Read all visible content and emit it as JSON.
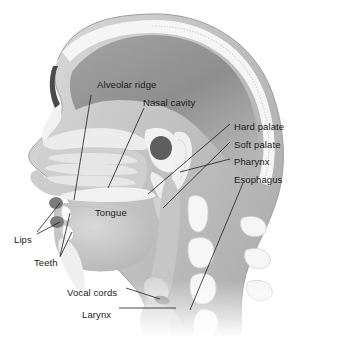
{
  "figure": {
    "view": "lateral midsagittal cutaway, facing left",
    "background_color": "#ffffff",
    "label_text_color": "#1a1a1a",
    "leader_line_color": "#1d1d1d",
    "tissue_light": "#e8e8e8",
    "tissue_mid": "#c9c9c9",
    "tissue_dark": "#9a9a9a",
    "bone_color": "#f4f4f4",
    "cavity_dark": "#6f6f6f"
  },
  "labels": [
    {
      "id": "alveolar-ridge",
      "text": "Alveolar ridge",
      "x": 97,
      "y": 80,
      "align": "left"
    },
    {
      "id": "nasal-cavity",
      "text": "Nasal cavity",
      "x": 143,
      "y": 98,
      "align": "left"
    },
    {
      "id": "hard-palate",
      "text": "Hard palate",
      "x": 234,
      "y": 122,
      "align": "left"
    },
    {
      "id": "soft-palate",
      "text": "Soft palate",
      "x": 234,
      "y": 140,
      "align": "left"
    },
    {
      "id": "pharynx",
      "text": "Pharynx",
      "x": 234,
      "y": 157,
      "align": "left"
    },
    {
      "id": "esophagus",
      "text": "Esophagus",
      "x": 234,
      "y": 175,
      "align": "left"
    },
    {
      "id": "tongue",
      "text": "Tongue",
      "x": 95,
      "y": 208,
      "align": "left"
    },
    {
      "id": "lips",
      "text": "Lips",
      "x": 14,
      "y": 235,
      "align": "left"
    },
    {
      "id": "teeth",
      "text": "Teeth",
      "x": 34,
      "y": 258,
      "align": "left"
    },
    {
      "id": "vocal-cords",
      "text": "Vocal cords",
      "x": 67,
      "y": 288,
      "align": "left"
    },
    {
      "id": "larynx",
      "text": "Larynx",
      "x": 82,
      "y": 310,
      "align": "left"
    }
  ],
  "leaders": [
    {
      "id": "leader-alveolar-ridge",
      "points": "91,95 74,200"
    },
    {
      "id": "leader-nasal-cavity",
      "points": "144,108 108,188"
    },
    {
      "id": "leader-hard-palate",
      "points": "230,124 148,194"
    },
    {
      "id": "leader-soft-palate",
      "points": "230,142 163,208"
    },
    {
      "id": "leader-pharynx",
      "points": "230,159 180,172"
    },
    {
      "id": "leader-esophagus",
      "points": "243,183 190,310"
    },
    {
      "id": "leader-lips-upper",
      "points": "37,232 60,203"
    },
    {
      "id": "leader-lips-lower",
      "points": "37,234 60,222"
    },
    {
      "id": "leader-teeth-upper",
      "points": "60,256 70,213"
    },
    {
      "id": "leader-teeth-lower",
      "points": "60,257 72,232"
    },
    {
      "id": "leader-vocal-cords",
      "points": "126,288 160,299"
    },
    {
      "id": "leader-larynx",
      "points": "119,308 176,308"
    }
  ],
  "structures": [
    {
      "id": "cranium",
      "name": "skull-cranium"
    },
    {
      "id": "brain-cavity",
      "name": "brain-cavity"
    },
    {
      "id": "frontal-sinus",
      "name": "frontal-sinus"
    },
    {
      "id": "nasal-turbinates",
      "name": "nasal-turbinates"
    },
    {
      "id": "nasal-cavity-space",
      "name": "nasal-cavity-space"
    },
    {
      "id": "sphenoid-bone",
      "name": "sphenoid-bone"
    },
    {
      "id": "hard-palate-bone",
      "name": "hard-palate-bone"
    },
    {
      "id": "soft-palate-uvula",
      "name": "soft-palate-uvula"
    },
    {
      "id": "tongue-body",
      "name": "tongue-body"
    },
    {
      "id": "upper-lip",
      "name": "upper-lip"
    },
    {
      "id": "lower-lip",
      "name": "lower-lip"
    },
    {
      "id": "upper-teeth",
      "name": "upper-teeth"
    },
    {
      "id": "lower-teeth",
      "name": "lower-teeth"
    },
    {
      "id": "mandible",
      "name": "mandible-bone"
    },
    {
      "id": "pharynx-space",
      "name": "pharyngeal-cavity"
    },
    {
      "id": "epiglottis",
      "name": "epiglottis"
    },
    {
      "id": "vocal-folds",
      "name": "vocal-folds"
    },
    {
      "id": "larynx-body",
      "name": "larynx"
    },
    {
      "id": "esophagus-tube",
      "name": "esophagus-tube"
    },
    {
      "id": "cervical-vertebrae",
      "name": "cervical-vertebrae"
    },
    {
      "id": "spinous-processes",
      "name": "spinous-processes"
    }
  ]
}
